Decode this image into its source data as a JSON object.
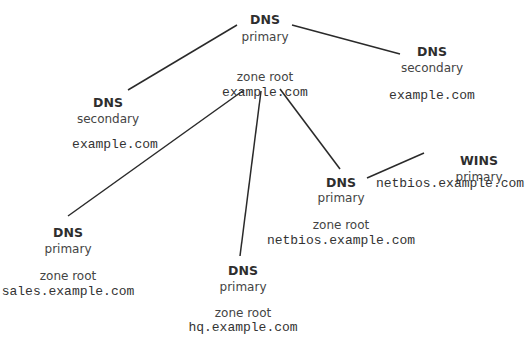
{
  "diagram": {
    "nodes": [
      {
        "id": "root",
        "type": "DNS",
        "role": "primary",
        "zone_label": "zone root",
        "domain": "example.com"
      },
      {
        "id": "secondary_left",
        "type": "DNS",
        "role": "secondary",
        "domain": "example.com"
      },
      {
        "id": "secondary_right",
        "type": "DNS",
        "role": "secondary",
        "domain": "example.com"
      },
      {
        "id": "netbios",
        "type": "DNS",
        "role": "primary",
        "zone_label": "zone root",
        "domain": "netbios.example.com"
      },
      {
        "id": "wins",
        "type": "WINS",
        "role": "primary",
        "domain": "netbios.example.com"
      },
      {
        "id": "sales",
        "type": "DNS",
        "role": "primary",
        "zone_label": "zone root",
        "domain": "sales.example.com"
      },
      {
        "id": "hq",
        "type": "DNS",
        "role": "primary",
        "zone_label": "zone root",
        "domain": "hq.example.com"
      }
    ],
    "edges": [
      {
        "from": "root",
        "to": "secondary_left"
      },
      {
        "from": "root",
        "to": "secondary_right"
      },
      {
        "from": "root",
        "to": "sales"
      },
      {
        "from": "root",
        "to": "hq"
      },
      {
        "from": "root",
        "to": "netbios"
      },
      {
        "from": "netbios",
        "to": "wins"
      }
    ],
    "colors": {
      "line": "#2a2a2a",
      "text": "#3a3a3a",
      "background": "#ffffff"
    }
  }
}
